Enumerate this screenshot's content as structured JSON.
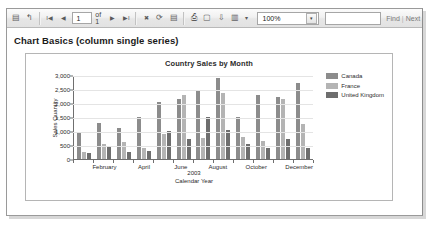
{
  "toolbar": {
    "buttons": [
      {
        "name": "document-map-icon",
        "glyph": "▤"
      },
      {
        "name": "back-to-parent-icon",
        "glyph": "↰"
      }
    ],
    "nav": {
      "first_glyph": "I◀",
      "prev_glyph": "◀",
      "current_page": "1",
      "of_label": "of 1",
      "next_glyph": "▶",
      "last_glyph": "▶I"
    },
    "actions": [
      {
        "name": "stop-icon",
        "glyph": "✖"
      },
      {
        "name": "refresh-icon",
        "glyph": "⟳"
      },
      {
        "name": "print-layout-icon",
        "glyph": "▤"
      },
      {
        "name": "print-icon",
        "glyph": "⎙"
      },
      {
        "name": "page-setup-icon",
        "glyph": "▢"
      },
      {
        "name": "export-icon",
        "glyph": "⇩"
      },
      {
        "name": "save-export-icon",
        "glyph": "▥"
      },
      {
        "name": "export-dropdown-icon",
        "glyph": "▾"
      }
    ],
    "zoom_value": "100%",
    "zoom_arrow_glyph": "▾",
    "find_label": "Find",
    "find_separator": "|",
    "next_label": "Next",
    "find_placeholder": ""
  },
  "report": {
    "title": "Chart Basics (column single series)"
  },
  "chart_data": {
    "type": "bar",
    "title": "Country Sales by Month",
    "xlabel": "Calendar Year",
    "ylabel": "Sales Quantity",
    "group_label": "2003",
    "categories": [
      "January",
      "February",
      "March",
      "April",
      "May",
      "June",
      "July",
      "August",
      "September",
      "October",
      "November",
      "December"
    ],
    "tick_labels": [
      "",
      "February",
      "",
      "April",
      "",
      "June",
      "",
      "August",
      "",
      "October",
      "",
      "December"
    ],
    "visible_tick_labels": [
      "February",
      "April",
      "June",
      "August",
      "October",
      "December"
    ],
    "series": [
      {
        "name": "Canada",
        "color": "#8c8c8c",
        "values": [
          950,
          1300,
          1100,
          1500,
          2050,
          2150,
          2450,
          2900,
          1500,
          2300,
          2200,
          2700
        ]
      },
      {
        "name": "France",
        "color": "#b4b4b4",
        "values": [
          250,
          550,
          600,
          400,
          900,
          2300,
          750,
          2350,
          800,
          650,
          2150,
          1250
        ]
      },
      {
        "name": "United Kingdom",
        "color": "#6e6e6e",
        "values": [
          230,
          430,
          250,
          280,
          1000,
          700,
          1500,
          1050,
          550,
          400,
          700,
          400
        ]
      }
    ],
    "yticks": [
      "0",
      "500",
      "1,000",
      "1,500",
      "2,000",
      "2,500",
      "3,000"
    ],
    "ylim": [
      0,
      3000
    ],
    "grid": true,
    "legend_position": "top-right"
  }
}
